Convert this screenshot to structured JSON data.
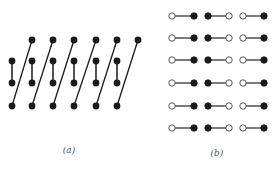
{
  "panels": {
    "a": {
      "label": "(a)",
      "label_pos": [
        69,
        145
      ],
      "node_radius": 3.4,
      "node_color": "#1a1a1a",
      "edge_color": "#1a1a1a",
      "top_row": {
        "y": 40,
        "xs": [
          32,
          53,
          74,
          96,
          117,
          138
        ]
      },
      "mid_upper_row": {
        "y": 61,
        "xs": [
          12,
          32,
          53,
          74,
          96,
          117
        ]
      },
      "mid_lower_row": {
        "y": 83,
        "xs": [
          12,
          32,
          53,
          74,
          96,
          117
        ]
      },
      "bottom_row": {
        "y": 106,
        "xs": [
          12,
          32,
          53,
          74,
          96,
          117
        ]
      },
      "vertical_bonds": "mid_upper_row[i] to mid_lower_row[i]",
      "diagonal_bonds": "bottom_row[i] to top_row[i]"
    },
    "b": {
      "label": "(b)",
      "label_pos": [
        217,
        148
      ],
      "node_radius": 3.2,
      "filled_color": "#1a1a1a",
      "open_fill": "#ffffff",
      "edge_color": "#333333",
      "row_ys": [
        16,
        38,
        60,
        83,
        106,
        128
      ],
      "pairs": [
        {
          "left": {
            "x": 172,
            "type": "open"
          },
          "right": {
            "x": 194,
            "type": "filled"
          }
        },
        {
          "left": {
            "x": 208,
            "type": "filled"
          },
          "right": {
            "x": 229,
            "type": "open"
          }
        },
        {
          "left": {
            "x": 243,
            "type": "open"
          },
          "right": {
            "x": 264,
            "type": "filled"
          }
        }
      ]
    }
  }
}
